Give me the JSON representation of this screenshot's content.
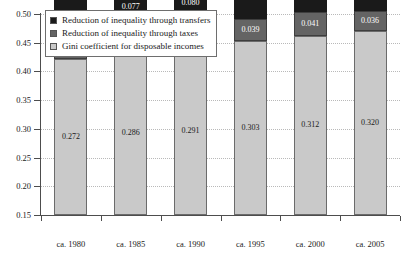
{
  "chart_data": {
    "type": "bar",
    "stacked": true,
    "title": "",
    "subtitle": "",
    "xlabel": "",
    "ylabel": "",
    "ylim": [
      0.15,
      0.5
    ],
    "ytick_values": [
      0.15,
      0.2,
      0.25,
      0.3,
      0.35,
      0.4,
      0.45,
      0.5
    ],
    "ytick_labels": [
      "0.15",
      "0.20",
      "0.25",
      "0.30",
      "0.35",
      "0.40",
      "0.45",
      "0.50"
    ],
    "grid": true,
    "grid_style": "dotted-horizontal",
    "legend_position": "upper-left-inside",
    "categories": [
      "ca. 1980",
      "ca. 1985",
      "ca. 1990",
      "ca. 1995",
      "ca. 2000",
      "ca. 2005"
    ],
    "series": [
      {
        "name": "Gini coefficient for disposable incomes",
        "color": "#c9c9c9",
        "stack_order": 0,
        "values": [
          0.272,
          0.286,
          0.291,
          0.303,
          0.312,
          0.32
        ],
        "labels": [
          "0.272",
          "0.286",
          "0.291",
          "0.303",
          "0.312",
          "0.320"
        ]
      },
      {
        "name": "Reduction of inequality through taxes",
        "color": "#646464",
        "stack_order": 1,
        "values": [
          0.036,
          0.038,
          0.039,
          0.039,
          0.041,
          0.036
        ],
        "labels": [
          "0.036",
          "0.038",
          "0.039",
          "0.039",
          "0.041",
          "0.036"
        ]
      },
      {
        "name": "Reduction of inequality through transfers",
        "color": "#1a1a1a",
        "stack_order": 2,
        "values": [
          0.067,
          0.077,
          0.08,
          0.091,
          0.091,
          0.094
        ],
        "labels": [
          "0.067",
          "0.077",
          "0.080",
          "0.091",
          "0.091",
          "0.094"
        ]
      }
    ],
    "totals": [
      0.375,
      0.401,
      0.41,
      0.433,
      0.444,
      0.45
    ]
  },
  "legend": {
    "entries": [
      {
        "label": "Reduction of inequality through transfers",
        "color": "#1a1a1a"
      },
      {
        "label": "Reduction of inequality through taxes",
        "color": "#646464"
      },
      {
        "label": "Gini coefficient for disposable incomes",
        "color": "#c9c9c9"
      }
    ]
  }
}
